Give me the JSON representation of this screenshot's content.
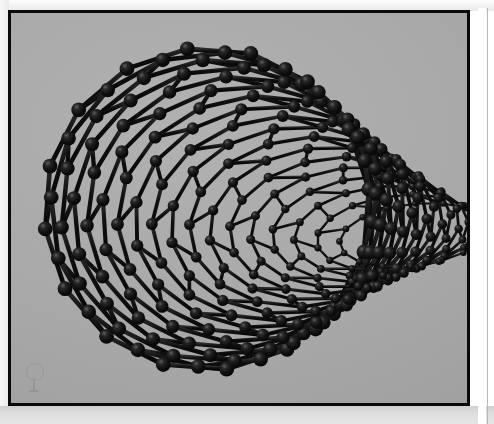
{
  "page": {
    "background_color": "#ffffff",
    "margin_tint_color": "#e9e9e9",
    "right_rule_color": "#b9b9b9"
  },
  "figure": {
    "caption": "",
    "alt_text": "Ball-and-stick molecular model of a single-walled carbon nanotube viewed in perspective down its axis",
    "subject": "carbon nanotube",
    "render_style": "ball-and-stick",
    "border_color": "#0a0a0a",
    "border_width_px": 3,
    "background_color": "#a8a8a8",
    "atom_color": "#0c0c0c",
    "bond_color": "#141414",
    "highlight_color": "#6a6a6a",
    "plate": {
      "x": 8,
      "y": 10,
      "width": 462,
      "height": 396
    }
  },
  "model": {
    "type": "nanotube",
    "lattice": "hexagonal-graphene",
    "rings_around_circumference": 16,
    "rings_along_axis": 17,
    "atom_radius_px": 7.4,
    "bond_thickness_px": 4.6,
    "axis_direction": "receding to upper-right",
    "near_opening": "left",
    "far_opening": "right",
    "tube_radius_px": 163,
    "near_center": {
      "x": 196,
      "y": 196
    },
    "far_center": {
      "x": 402,
      "y": 222
    },
    "far_radius_px": 74,
    "twist_degrees": 16,
    "perspective_squash_near": 0.99,
    "perspective_squash_far": 0.42
  },
  "watermark": {
    "visible": true,
    "shape": "circle-with-stem",
    "opacity": 0.1,
    "color": "#202020"
  }
}
